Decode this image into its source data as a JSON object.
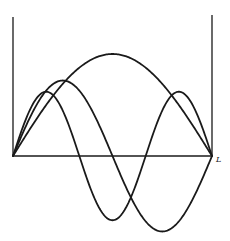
{
  "diagram": {
    "title": "",
    "axis_end_label": "L",
    "colors": {
      "line": "#1a1a1a",
      "background": "#ffffff"
    }
  },
  "chart_data": {
    "type": "line",
    "title": "",
    "xlabel": "",
    "ylabel": "",
    "x_tick_labels": [
      "L"
    ],
    "xlim": [
      0,
      1
    ],
    "series": [
      {
        "name": "n=1",
        "function": "A*sin(1*pi*x/L)",
        "amplitude": 1.0
      },
      {
        "name": "n=2",
        "function": "A*sin(2*pi*x/L)",
        "amplitude": 0.74
      },
      {
        "name": "n=3",
        "function": "A*sin(3*pi*x/L)",
        "amplitude": 0.63
      }
    ],
    "grid": false,
    "legend": "none"
  },
  "layout_px": {
    "x0": 13,
    "x1": 212,
    "axis_y": 156,
    "wall_top_left": 17,
    "wall_top_right": 15,
    "amp_scale": 102
  }
}
